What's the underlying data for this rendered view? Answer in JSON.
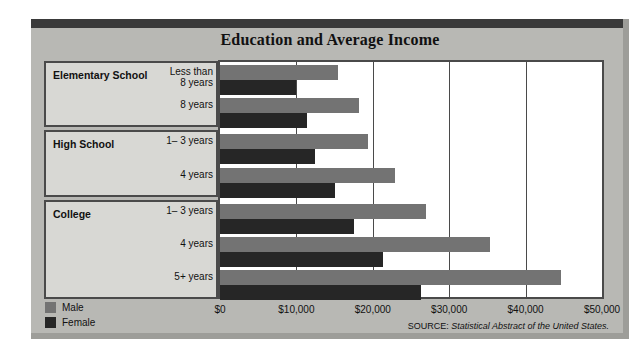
{
  "chart_data": {
    "type": "bar",
    "orientation": "horizontal",
    "title": "Education and Average Income",
    "xlabel": "",
    "ylabel": "",
    "xlim": [
      0,
      50000
    ],
    "grid": true,
    "legend_position": "bottom-left",
    "tick_labels": [
      "$0",
      "$10,000",
      "$20,000",
      "$30,000",
      "$40,000",
      "$50,000"
    ],
    "tick_values": [
      0,
      10000,
      20000,
      30000,
      40000,
      50000
    ],
    "groups": [
      {
        "name": "Elementary School",
        "rows": [
          {
            "label": "Less than\n8 years",
            "male": 15500,
            "female": 9900
          },
          {
            "label": "8 years",
            "male": 18200,
            "female": 11400
          }
        ]
      },
      {
        "name": "High School",
        "rows": [
          {
            "label": "1– 3 years",
            "male": 19400,
            "female": 12400
          },
          {
            "label": "4 years",
            "male": 22900,
            "female": 15100
          }
        ]
      },
      {
        "name": "College",
        "rows": [
          {
            "label": "1– 3 years",
            "male": 26900,
            "female": 17500
          },
          {
            "label": "4 years",
            "male": 35400,
            "female": 21300
          },
          {
            "label": "5+ years",
            "male": 44600,
            "female": 26300
          }
        ]
      }
    ],
    "series": [
      {
        "name": "Male",
        "color": "#737373",
        "categories": [
          "Less than 8 years",
          "8 years",
          "High School 1-3 years",
          "High School 4 years",
          "College 1-3 years",
          "College 4 years",
          "College 5+ years"
        ],
        "values": [
          15500,
          18200,
          19400,
          22900,
          26900,
          35400,
          44600
        ]
      },
      {
        "name": "Female",
        "color": "#262626",
        "categories": [
          "Less than 8 years",
          "8 years",
          "High School 1-3 years",
          "High School 4 years",
          "College 1-3 years",
          "College 4 years",
          "College 5+ years"
        ],
        "values": [
          9900,
          11400,
          12400,
          15100,
          17500,
          21300,
          26300
        ]
      }
    ]
  },
  "legend": {
    "male_label": "Male",
    "female_label": "Female"
  },
  "source": {
    "prefix": "SOURCE:",
    "text": "Statistical Abstract of the United States."
  }
}
